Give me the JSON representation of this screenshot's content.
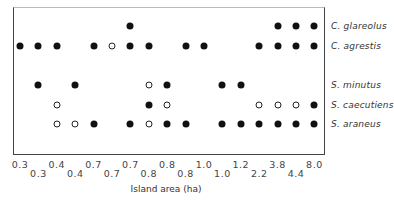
{
  "chart_data": {
    "type": "scatter",
    "title": "",
    "xlabel": "Island area (ha)",
    "ylabel": "",
    "grid": false,
    "legend": "none (filled circle = present, open circle = open marker)",
    "columns": [
      "0.3",
      "0.3",
      "0.4",
      "0.4",
      "0.7",
      "0.7",
      "0.7",
      "0.8",
      "0.8",
      "0.8",
      "1.0",
      "1.0",
      "1.2",
      "2.2",
      "3.8",
      "4.4",
      "8.0"
    ],
    "tick_labels_top_row": [
      "0.3",
      "0.4",
      "0.7",
      "0.7",
      "0.8",
      "1.0",
      "1.2",
      "3.8",
      "8.0"
    ],
    "tick_labels_bottom_row": [
      "0.3",
      "0.4",
      "0.7",
      "0.8",
      "0.8",
      "1.0",
      "2.2",
      "4.4"
    ],
    "series": [
      {
        "name": "C. glareolus",
        "y": 26,
        "points": [
          {
            "col": 6,
            "fill": "filled"
          },
          {
            "col": 14,
            "fill": "filled"
          },
          {
            "col": 15,
            "fill": "filled"
          },
          {
            "col": 16,
            "fill": "filled"
          }
        ]
      },
      {
        "name": "C. agrestis",
        "y": 46,
        "points": [
          {
            "col": 0,
            "fill": "filled"
          },
          {
            "col": 1,
            "fill": "filled"
          },
          {
            "col": 2,
            "fill": "filled"
          },
          {
            "col": 4,
            "fill": "filled"
          },
          {
            "col": 5,
            "fill": "open"
          },
          {
            "col": 6,
            "fill": "filled"
          },
          {
            "col": 7,
            "fill": "filled"
          },
          {
            "col": 9,
            "fill": "filled"
          },
          {
            "col": 10,
            "fill": "filled"
          },
          {
            "col": 13,
            "fill": "filled"
          },
          {
            "col": 14,
            "fill": "filled"
          },
          {
            "col": 15,
            "fill": "filled"
          },
          {
            "col": 16,
            "fill": "filled"
          }
        ]
      },
      {
        "name": "S. minutus",
        "y": 85,
        "points": [
          {
            "col": 1,
            "fill": "filled"
          },
          {
            "col": 3,
            "fill": "filled"
          },
          {
            "col": 7,
            "fill": "open"
          },
          {
            "col": 8,
            "fill": "filled"
          },
          {
            "col": 11,
            "fill": "filled"
          },
          {
            "col": 12,
            "fill": "filled"
          }
        ]
      },
      {
        "name": "S. caecutiens",
        "y": 105,
        "points": [
          {
            "col": 2,
            "fill": "open"
          },
          {
            "col": 7,
            "fill": "filled"
          },
          {
            "col": 8,
            "fill": "open"
          },
          {
            "col": 13,
            "fill": "open"
          },
          {
            "col": 14,
            "fill": "open"
          },
          {
            "col": 15,
            "fill": "open"
          },
          {
            "col": 16,
            "fill": "filled"
          }
        ]
      },
      {
        "name": "S. araneus",
        "y": 124,
        "points": [
          {
            "col": 2,
            "fill": "open"
          },
          {
            "col": 3,
            "fill": "open"
          },
          {
            "col": 4,
            "fill": "filled"
          },
          {
            "col": 6,
            "fill": "filled"
          },
          {
            "col": 7,
            "fill": "open"
          },
          {
            "col": 8,
            "fill": "filled"
          },
          {
            "col": 9,
            "fill": "filled"
          },
          {
            "col": 11,
            "fill": "filled"
          },
          {
            "col": 12,
            "fill": "filled"
          },
          {
            "col": 13,
            "fill": "filled"
          },
          {
            "col": 14,
            "fill": "filled"
          },
          {
            "col": 15,
            "fill": "filled"
          },
          {
            "col": 16,
            "fill": "filled"
          }
        ]
      }
    ]
  },
  "layout": {
    "col_x0": 20,
    "col_dx": 18.4,
    "tick_top_y": 159,
    "tick_bottom_y": 168
  },
  "colors": {
    "filled": "#111111",
    "open_border": "#222222",
    "frame": "#444444"
  }
}
